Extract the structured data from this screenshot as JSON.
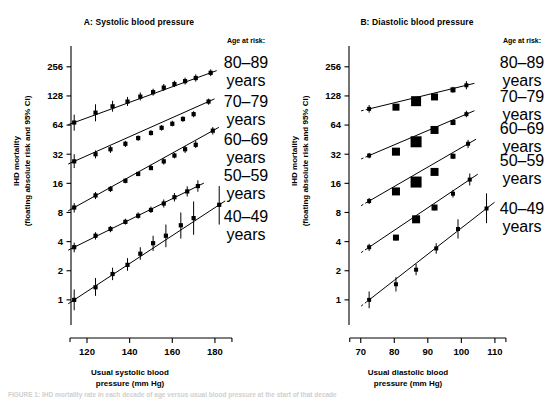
{
  "figure": {
    "caption": "FIGURE 1: IHD mortality rate in each decade of age versus usual blood pressure at the start of that decade"
  },
  "panels": [
    {
      "id": "A",
      "title": "A: Systolic blood pressure",
      "ylabel_line1": "IHD mortality",
      "ylabel_line2": "(floating absolute risk and 95% CI)",
      "xlabel_line1": "Usual systolic blood",
      "xlabel_line2": "pressure (mm Hg)",
      "legend_header": "Age at risk:",
      "legend_items": [
        {
          "range": "80–89",
          "unit": "years"
        },
        {
          "range": "70–79",
          "unit": "years"
        },
        {
          "range": "60–69",
          "unit": "years"
        },
        {
          "range": "50–59",
          "unit": "years"
        },
        {
          "range": "40–49",
          "unit": "years"
        }
      ]
    },
    {
      "id": "B",
      "title": "B: Diastolic blood pressure",
      "ylabel_line1": "IHD mortality",
      "ylabel_line2": "(floating absolute risk and 95% CI)",
      "xlabel_line1": "Usual diastolic blood",
      "xlabel_line2": "pressure (mm Hg)",
      "legend_header": "Age at risk:",
      "legend_items": [
        {
          "range": "80–89",
          "unit": "years"
        },
        {
          "range": "70–79",
          "unit": "years"
        },
        {
          "range": "60–69",
          "unit": "years"
        },
        {
          "range": "50–59",
          "unit": "years"
        },
        {
          "range": "40–49",
          "unit": "years"
        }
      ]
    }
  ],
  "chart_data": [
    {
      "type": "scatter",
      "title": "A: Systolic blood pressure",
      "xlabel": "Usual systolic blood pressure (mm Hg)",
      "ylabel": "IHD mortality (floating absolute risk and 95% CI)",
      "yscale": "log2",
      "yticks": [
        1,
        2,
        4,
        8,
        16,
        32,
        64,
        128,
        256
      ],
      "ylim": [
        0.55,
        420
      ],
      "xticks": [
        120,
        140,
        160,
        180
      ],
      "xlim": [
        112,
        188
      ],
      "grid": false,
      "legend_position": "right",
      "series": [
        {
          "name": "80-89 years",
          "x": [
            114,
            124,
            132,
            139,
            145,
            151,
            156,
            161,
            166,
            171,
            178
          ],
          "y": [
            68,
            86,
            100,
            112,
            126,
            140,
            156,
            170,
            182,
            196,
            222
          ],
          "ylow": [
            56,
            70,
            88,
            101,
            115,
            129,
            144,
            158,
            168,
            180,
            205
          ],
          "yhigh": [
            82,
            105,
            114,
            125,
            139,
            152,
            170,
            184,
            198,
            214,
            241
          ]
        },
        {
          "name": "70-79 years",
          "x": [
            114,
            124,
            131,
            138,
            144,
            150,
            155,
            160,
            165,
            170,
            177
          ],
          "y": [
            27,
            32,
            36,
            41,
            47,
            53,
            60,
            66,
            74,
            83,
            112
          ],
          "ylow": [
            23,
            29,
            33,
            38,
            44,
            50,
            56,
            62,
            69,
            77,
            104
          ],
          "yhigh": [
            32,
            35,
            39,
            44,
            50,
            57,
            64,
            71,
            79,
            89,
            120
          ]
        },
        {
          "name": "60-69 years",
          "x": [
            114,
            124,
            131,
            138,
            144,
            150,
            156,
            161,
            166,
            171,
            179
          ],
          "y": [
            9,
            12,
            14,
            17,
            20,
            23,
            27,
            31,
            36,
            40,
            56
          ],
          "ylow": [
            8,
            11,
            13,
            16,
            19,
            22,
            25,
            29,
            33,
            37,
            51
          ],
          "yhigh": [
            10,
            13,
            15,
            18,
            21,
            25,
            29,
            33,
            39,
            44,
            61
          ]
        },
        {
          "name": "50-59 years",
          "x": [
            114,
            124,
            131,
            138,
            144,
            150,
            156,
            161,
            167,
            172
          ],
          "y": [
            3.5,
            4.6,
            5.4,
            6.4,
            7.4,
            8.5,
            9.9,
            11.5,
            13.2,
            15.0
          ],
          "ylow": [
            3.1,
            4.2,
            5.0,
            6.0,
            6.9,
            7.9,
            9.0,
            10.4,
            11.7,
            13.1
          ],
          "yhigh": [
            3.9,
            5.0,
            5.8,
            6.9,
            8.0,
            9.2,
            10.9,
            12.7,
            14.9,
            17.2
          ]
        },
        {
          "name": "40-49 years",
          "x": [
            114,
            124,
            132,
            139,
            145,
            151,
            157,
            164,
            170,
            182
          ],
          "y": [
            1.0,
            1.35,
            1.85,
            2.3,
            3.0,
            3.85,
            4.6,
            5.9,
            7.0,
            9.6
          ],
          "ylow": [
            0.78,
            1.1,
            1.6,
            2.0,
            2.6,
            3.2,
            3.5,
            4.3,
            4.7,
            6.0
          ],
          "yhigh": [
            1.28,
            1.68,
            2.15,
            2.7,
            3.5,
            4.6,
            6.0,
            8.0,
            10.4,
            15.0
          ]
        }
      ]
    },
    {
      "type": "scatter",
      "title": "B: Diastolic blood pressure",
      "xlabel": "Usual diastolic blood pressure (mm Hg)",
      "ylabel": "IHD mortality (floating absolute risk and 95% CI)",
      "yscale": "log2",
      "yticks": [
        1,
        2,
        4,
        8,
        16,
        32,
        64,
        128,
        256
      ],
      "ylim": [
        0.55,
        420
      ],
      "xticks": [
        70,
        80,
        90,
        100,
        110
      ],
      "xlim": [
        66,
        115
      ],
      "grid": false,
      "legend_position": "right",
      "series": [
        {
          "name": "80-89 years",
          "x": [
            72.5,
            80.5,
            86.5,
            92,
            97.5,
            101.5
          ],
          "y": [
            94,
            98,
            113,
            125,
            148,
            165
          ],
          "ylow": [
            86,
            92,
            107,
            118,
            138,
            150
          ],
          "yhigh": [
            103,
            105,
            120,
            133,
            159,
            182
          ],
          "marker_size": [
            4,
            7,
            10,
            7,
            5,
            4
          ]
        },
        {
          "name": "70-79 years",
          "x": [
            72.5,
            80.5,
            86.5,
            92,
            97.5,
            101.5
          ],
          "y": [
            31,
            34,
            43,
            57,
            68,
            83
          ],
          "ylow": [
            29,
            32,
            41,
            54,
            64,
            77
          ],
          "yhigh": [
            33,
            36,
            45,
            60,
            72,
            90
          ],
          "marker_size": [
            4,
            8,
            11,
            8,
            5,
            4
          ]
        },
        {
          "name": "60-69 years",
          "x": [
            72.5,
            80.5,
            86.5,
            92,
            97.5,
            102
          ],
          "y": [
            10.5,
            13.2,
            16.5,
            21,
            30.5,
            41
          ],
          "ylow": [
            9.8,
            12.4,
            15.6,
            19.8,
            28.5,
            37
          ],
          "yhigh": [
            11.3,
            14.1,
            17.5,
            22.3,
            32.5,
            45
          ],
          "marker_size": [
            4,
            8,
            11,
            8,
            5,
            4
          ]
        },
        {
          "name": "50-59 years",
          "x": [
            72.5,
            80.5,
            86.5,
            92,
            97.5,
            102.5
          ],
          "y": [
            3.5,
            4.4,
            6.8,
            9.0,
            12.5,
            17.5
          ],
          "ylow": [
            3.2,
            4.1,
            6.4,
            8.4,
            11.4,
            15.2
          ],
          "yhigh": [
            3.8,
            4.7,
            7.2,
            9.6,
            13.7,
            20.2
          ],
          "marker_size": [
            4,
            6,
            8,
            6,
            4,
            4
          ]
        },
        {
          "name": "40-49 years",
          "x": [
            72.5,
            80.5,
            86.5,
            92.5,
            99,
            107.5
          ],
          "y": [
            1.0,
            1.45,
            2.05,
            3.4,
            5.4,
            8.8
          ],
          "ylow": [
            0.82,
            1.22,
            1.8,
            3.0,
            4.3,
            6.2
          ],
          "yhigh": [
            1.22,
            1.72,
            2.35,
            3.85,
            6.8,
            12.6
          ],
          "marker_size": [
            4,
            4,
            4,
            4,
            4,
            4
          ]
        }
      ]
    }
  ]
}
